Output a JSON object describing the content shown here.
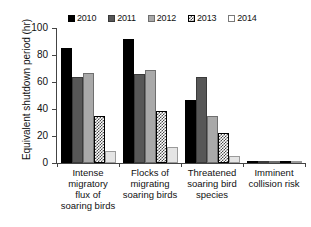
{
  "chart_data": {
    "type": "bar",
    "title": "",
    "xlabel": "",
    "ylabel": "Equivalent shutdown period (hr)",
    "ylim": [
      0,
      100
    ],
    "yticks": [
      0,
      20,
      40,
      60,
      80,
      100
    ],
    "grid": false,
    "legend_position": "top",
    "categories": [
      "Intense migratory flux of soaring birds",
      "Flocks of migrating soaring birds",
      "Threatened soaring bird species",
      "Imminent collision risk"
    ],
    "category_lines": [
      [
        "Intense",
        "migratory",
        "flux of",
        "soaring birds"
      ],
      [
        "Flocks of",
        "migrating",
        "soaring birds"
      ],
      [
        "Threatened",
        "soaring bird",
        "species"
      ],
      [
        "Imminent",
        "collision risk"
      ]
    ],
    "series": [
      {
        "name": "2010",
        "color": "#000000",
        "values": [
          85,
          92,
          47,
          0.3
        ]
      },
      {
        "name": "2011",
        "color": "#575757",
        "values": [
          63.5,
          66,
          63.5,
          0.4
        ]
      },
      {
        "name": "2012",
        "color": "#a9a9a9",
        "values": [
          67,
          69,
          35,
          0.5
        ]
      },
      {
        "name": "2013",
        "color": "#4a4a4a",
        "values": [
          34.5,
          38.5,
          22.5,
          1.5
        ]
      },
      {
        "name": "2014",
        "color": "#e4e4e4",
        "values": [
          9,
          11.5,
          5,
          0.3
        ]
      }
    ]
  },
  "legend": {
    "items": [
      {
        "label": "2010"
      },
      {
        "label": "2011"
      },
      {
        "label": "2012"
      },
      {
        "label": "2013"
      },
      {
        "label": "2014"
      }
    ]
  },
  "axes": {
    "y_label": "Equivalent shutdown period (hr)",
    "y_ticks": [
      "0",
      "20",
      "40",
      "60",
      "80",
      "100"
    ]
  }
}
